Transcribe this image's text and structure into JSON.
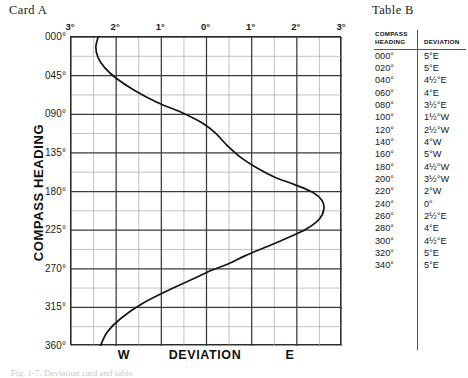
{
  "card": {
    "title": "Card A"
  },
  "table": {
    "title": "Table B",
    "headers": [
      "COMPASS HEADING",
      "DEVIATION"
    ],
    "header_line1": "COMPASS",
    "header_line2": "HEADING",
    "header_dev": "DEVIATION",
    "rows": [
      {
        "heading": "000°",
        "deviation": "5°E"
      },
      {
        "heading": "020°",
        "deviation": "5°E"
      },
      {
        "heading": "040°",
        "deviation": "4½°E"
      },
      {
        "heading": "060°",
        "deviation": "4°E"
      },
      {
        "heading": "080°",
        "deviation": "3½°E"
      },
      {
        "heading": "100°",
        "deviation": "1½°W"
      },
      {
        "heading": "120°",
        "deviation": "2½°W"
      },
      {
        "heading": "140°",
        "deviation": "4°W"
      },
      {
        "heading": "160°",
        "deviation": "5°W"
      },
      {
        "heading": "180°",
        "deviation": "4½°W"
      },
      {
        "heading": "200°",
        "deviation": "3½°W"
      },
      {
        "heading": "220°",
        "deviation": "2°W"
      },
      {
        "heading": "240°",
        "deviation": "0°"
      },
      {
        "heading": "260°",
        "deviation": "2½°E"
      },
      {
        "heading": "280°",
        "deviation": "4°E"
      },
      {
        "heading": "300°",
        "deviation": "4½°E"
      },
      {
        "heading": "320°",
        "deviation": "5°E"
      },
      {
        "heading": "340°",
        "deviation": "5°E"
      }
    ]
  },
  "caption": "Fig. 1-7. Deviation card and table.",
  "chart_data": {
    "type": "line",
    "title": "Card A",
    "xlabel": "DEVIATION",
    "ylabel": "COMPASS HEADING",
    "x_left_label": "W",
    "x_right_label": "E",
    "xlim": [
      -3,
      3
    ],
    "ylim": [
      0,
      360
    ],
    "grid": true,
    "legend": "none",
    "xticks": [
      -3,
      -2,
      -1,
      0,
      1,
      2,
      3
    ],
    "xticklabels": [
      "3°",
      "2°",
      "1°",
      "0°",
      "1°",
      "2°",
      "3°"
    ],
    "x_minor_step": 0.5,
    "yticks": [
      0,
      45,
      90,
      135,
      180,
      225,
      270,
      315,
      360
    ],
    "yticklabels": [
      "000°",
      "045°",
      "090°",
      "135°",
      "180°",
      "225°",
      "270°",
      "315°",
      "360°"
    ],
    "y_minor_step": 22.5,
    "series": [
      {
        "name": "Deviation curve",
        "x": [
          -2.4,
          -2.45,
          -2.4,
          -2.25,
          -2.0,
          -1.6,
          -1.1,
          -0.55,
          -0.1,
          0.2,
          0.45,
          0.75,
          1.1,
          1.5,
          1.95,
          2.35,
          2.55,
          2.6,
          2.5,
          2.2,
          1.75,
          1.3,
          0.85,
          0.45,
          0.1,
          -0.3,
          -0.8,
          -1.4,
          -1.9,
          -2.2,
          -2.35
        ],
        "y": [
          0,
          12,
          24,
          36,
          48,
          62,
          76,
          88,
          100,
          112,
          126,
          140,
          152,
          163,
          172,
          181,
          190,
          200,
          212,
          224,
          235,
          245,
          255,
          265,
          272,
          282,
          294,
          310,
          328,
          344,
          360
        ],
        "note": "E deviation positive (right of 0°), W deviation negative (left of 0°)"
      }
    ]
  }
}
